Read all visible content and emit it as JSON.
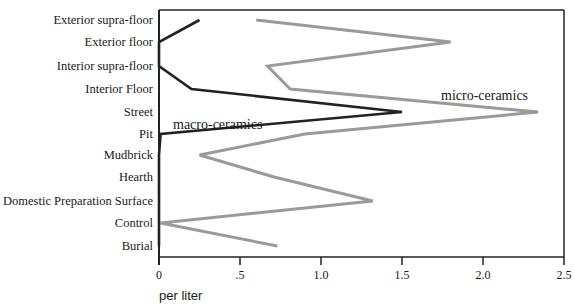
{
  "chart_data": {
    "type": "line",
    "orientation": "horizontal-profile",
    "title": "",
    "xlabel": "per liter",
    "ylabel": "",
    "xlim": [
      0,
      2.5
    ],
    "x_ticks": [
      {
        "value": 0,
        "label": "0"
      },
      {
        "value": 0.5,
        "label": ".5"
      },
      {
        "value": 1.0,
        "label": "1.0"
      },
      {
        "value": 1.5,
        "label": "1.5"
      },
      {
        "value": 2.0,
        "label": "2.0"
      },
      {
        "value": 2.5,
        "label": "2.5"
      }
    ],
    "grid": false,
    "legend": "inline labels",
    "categories": [
      "Exterior supra-floor",
      "Exterior floor",
      "Interior supra-floor",
      "Interior Floor",
      "Street",
      "Pit",
      "Mudbrick",
      "Hearth",
      "Domestic Preparation Surface",
      "Control",
      "Burial"
    ],
    "series": [
      {
        "name": "macro-ceramics",
        "color": "#222222",
        "values": [
          0.25,
          0.0,
          0.0,
          0.2,
          1.5,
          0.01,
          0.0,
          0.0,
          0.0,
          0.0,
          0.0
        ]
      },
      {
        "name": "micro-ceramics",
        "color": "#9a9a9a",
        "values": [
          0.6,
          1.8,
          0.67,
          0.81,
          2.34,
          0.9,
          0.25,
          0.71,
          1.32,
          0.01,
          0.73
        ]
      }
    ],
    "annotations": [
      {
        "text": "macro-ceramics",
        "near": "Street",
        "x_value": 0.1
      },
      {
        "text": "micro-ceramics",
        "near": "Interior Floor",
        "x_value": 1.75
      }
    ]
  }
}
